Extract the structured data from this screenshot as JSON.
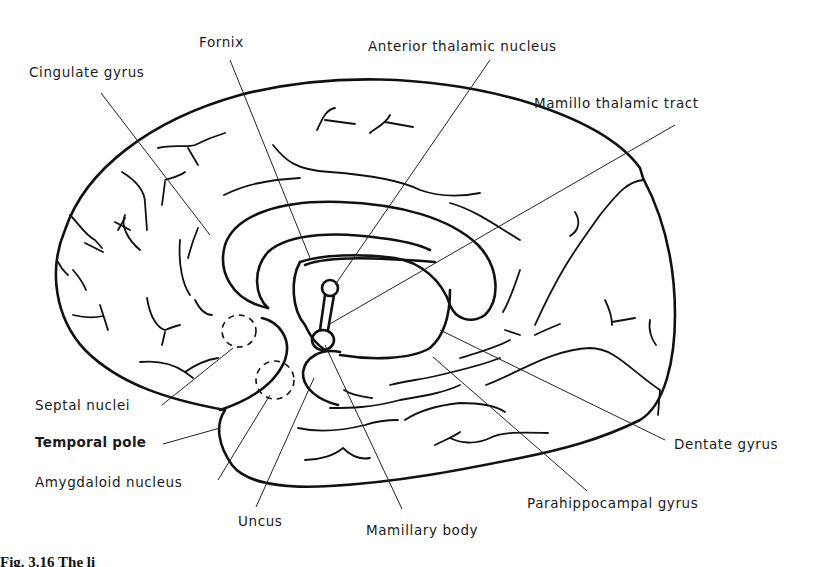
{
  "figure": {
    "type": "anatomical-line-drawing",
    "caption_partial": "Fig. 3.16 The li"
  },
  "labels": {
    "fornix": "Fornix",
    "anterior_thalamic_nucleus": "Anterior thalamic nucleus",
    "cingulate_gyrus": "Cingulate gyrus",
    "mamillo_thalamic_tract": "Mamillo thalamic tract",
    "septal_nuclei": "Septal nuclei",
    "temporal_pole": "Temporal pole",
    "amygdaloid_nucleus": "Amygdaloid nucleus",
    "uncus": "Uncus",
    "mamillary_body": "Mamillary body",
    "parahippocampal_gyrus": "Parahippocampal gyrus",
    "dentate_gyrus": "Dentate gyrus"
  },
  "colors": {
    "ink": "#111111",
    "background": "#ffffff"
  }
}
